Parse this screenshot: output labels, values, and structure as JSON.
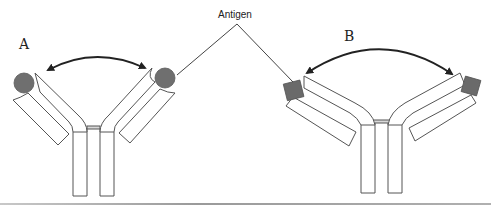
{
  "figure": {
    "panel_a_label": "A",
    "panel_b_label": "B",
    "antigen_label": "Antigen"
  },
  "colors": {
    "antigen_fill": "#6f6f6f",
    "outline": "#555555",
    "arrow": "#222222",
    "background": "#ffffff"
  },
  "panels": [
    {
      "id": "A",
      "description": "Antibody with narrow hinge angle binding two round antigens",
      "antigen_shape": "circle"
    },
    {
      "id": "B",
      "description": "Antibody with wide hinge angle binding two square antigens",
      "antigen_shape": "square"
    }
  ]
}
